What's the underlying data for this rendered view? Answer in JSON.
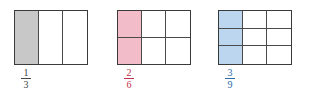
{
  "figures": [
    {
      "rows": 1,
      "cols": 3,
      "shaded_cols": 1,
      "shade_color": "#c8c8c8",
      "label_color": "#444444",
      "fraction": {
        "numerator": "1",
        "denominator": "3"
      }
    },
    {
      "rows": 2,
      "cols": 3,
      "shaded_cols": 1,
      "shade_color": "#f2bcc8",
      "label_color": "#c0304a",
      "fraction": {
        "numerator": "2",
        "denominator": "6"
      }
    },
    {
      "rows": 3,
      "cols": 3,
      "shaded_cols": 1,
      "shade_color": "#bcd6f0",
      "label_color": "#2a6aa8",
      "fraction": {
        "numerator": "3",
        "denominator": "9"
      }
    }
  ]
}
